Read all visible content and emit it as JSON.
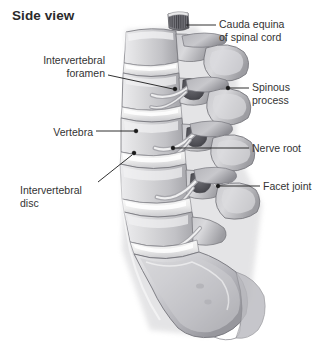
{
  "figure": {
    "title": "Side view",
    "background_color": "#ffffff",
    "line_color": "#1a1a1a",
    "text_color": "#333333",
    "title_color": "#2b2b2b"
  },
  "labels": [
    {
      "id": "cauda-equina",
      "text": "Cauda equina\nof spinal cord",
      "align": "left",
      "text_x": 219,
      "text_y": 18,
      "leader": {
        "x1": 216,
        "y1": 25,
        "x2": 186,
        "y2": 25
      },
      "marker": null
    },
    {
      "id": "spinous-process",
      "text": "Spinous\nprocess",
      "align": "left",
      "text_x": 252,
      "text_y": 81,
      "leader": {
        "x1": 249,
        "y1": 88,
        "x2": 229,
        "y2": 88
      },
      "marker": {
        "x": 228,
        "y": 88
      }
    },
    {
      "id": "nerve-root",
      "text": "Nerve root",
      "align": "left",
      "text_x": 252,
      "text_y": 142,
      "leader": {
        "x1": 249,
        "y1": 148,
        "x2": 174,
        "y2": 148
      },
      "marker": {
        "x": 173,
        "y": 148
      }
    },
    {
      "id": "facet-joint",
      "text": "Facet joint",
      "align": "left",
      "text_x": 263,
      "text_y": 180,
      "leader": {
        "x1": 260,
        "y1": 186,
        "x2": 219,
        "y2": 186
      },
      "marker": {
        "x": 218,
        "y": 186
      }
    },
    {
      "id": "intervertebral-foramen",
      "text": "Intervertebral\nforamen",
      "align": "right",
      "text_x": 30,
      "text_y": 54,
      "leader": {
        "x1": 108,
        "y1": 75,
        "x2": 174,
        "y2": 89
      },
      "marker": {
        "x": 175,
        "y": 89
      }
    },
    {
      "id": "vertebra",
      "text": "Vertebra",
      "align": "right",
      "text_x": 30,
      "text_y": 126,
      "leader": {
        "x1": 96,
        "y1": 131,
        "x2": 135,
        "y2": 131
      },
      "marker": {
        "x": 136,
        "y": 131
      }
    },
    {
      "id": "intervertebral-disc",
      "text": "Intervertebral\ndisc",
      "align": "right",
      "text_x": 20,
      "text_y": 184,
      "leader": {
        "x1": 98,
        "y1": 182,
        "x2": 133,
        "y2": 154
      },
      "marker": {
        "x": 134,
        "y": 153
      }
    }
  ],
  "anatomy": {
    "vertebral_bodies": 5,
    "discs": 4,
    "has_sacrum": true,
    "bone_fill": "#d8d8da",
    "bone_shadow": "#9b9b9f",
    "bone_highlight": "#f2f2f3",
    "disc_fill": "#f0f0f0",
    "outline": "#6e6e72"
  }
}
